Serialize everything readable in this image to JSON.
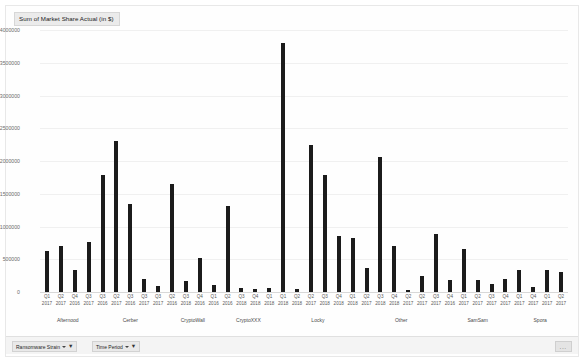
{
  "chart_data": {
    "type": "bar",
    "title": "Sum of Market Share Actual (in $)",
    "xlabel": "",
    "ylabel": "",
    "ylim": [
      0,
      4000000
    ],
    "grid": true,
    "legend_position": "none",
    "ytick_labels": [
      "4000000",
      "3500000",
      "3000000",
      "2500000",
      "2000000",
      "1500000",
      "1000000",
      "500000",
      "0"
    ],
    "ytick_values": [
      4000000,
      3500000,
      3000000,
      2500000,
      2000000,
      1500000,
      1000000,
      500000,
      0
    ],
    "groups": [
      {
        "name": "Afternood",
        "start_index": 0,
        "count": 4
      },
      {
        "name": "Cerber",
        "start_index": 4,
        "count": 5
      },
      {
        "name": "CryptoWall",
        "start_index": 9,
        "count": 4
      },
      {
        "name": "CryptoXXX",
        "start_index": 13,
        "count": 4
      },
      {
        "name": "Locky",
        "start_index": 17,
        "count": 6
      },
      {
        "name": "Other",
        "start_index": 23,
        "count": 6
      },
      {
        "name": "SamSam",
        "start_index": 29,
        "count": 5
      },
      {
        "name": "Spora",
        "start_index": 34,
        "count": 4
      }
    ],
    "categories": [
      {
        "quarter": "Q1",
        "year": "2017"
      },
      {
        "quarter": "Q2",
        "year": "2017"
      },
      {
        "quarter": "Q4",
        "year": "2016"
      },
      {
        "quarter": "Q3",
        "year": "2017"
      },
      {
        "quarter": "Q3",
        "year": "2016"
      },
      {
        "quarter": "Q2",
        "year": "2017"
      },
      {
        "quarter": "Q3",
        "year": "2016"
      },
      {
        "quarter": "Q3",
        "year": "2017"
      },
      {
        "quarter": "Q3",
        "year": "2017"
      },
      {
        "quarter": "Q2",
        "year": "2016"
      },
      {
        "quarter": "Q3",
        "year": "2018"
      },
      {
        "quarter": "Q4",
        "year": "2016"
      },
      {
        "quarter": "Q1",
        "year": "2016"
      },
      {
        "quarter": "Q2",
        "year": "2016"
      },
      {
        "quarter": "Q3",
        "year": "2018"
      },
      {
        "quarter": "Q4",
        "year": "2018"
      },
      {
        "quarter": "Q1",
        "year": "2018"
      },
      {
        "quarter": "Q1",
        "year": "2018"
      },
      {
        "quarter": "Q2",
        "year": "2018"
      },
      {
        "quarter": "Q2",
        "year": "2017"
      },
      {
        "quarter": "Q3",
        "year": "2018"
      },
      {
        "quarter": "Q4",
        "year": "2018"
      },
      {
        "quarter": "Q1",
        "year": "2018"
      },
      {
        "quarter": "Q2",
        "year": "2017"
      },
      {
        "quarter": "Q3",
        "year": "2018"
      },
      {
        "quarter": "Q4",
        "year": "2018"
      },
      {
        "quarter": "Q2",
        "year": "2017"
      },
      {
        "quarter": "Q2",
        "year": "2017"
      },
      {
        "quarter": "Q3",
        "year": "2017"
      },
      {
        "quarter": "Q4",
        "year": "2016"
      },
      {
        "quarter": "Q1",
        "year": "2017"
      },
      {
        "quarter": "Q2",
        "year": "2017"
      },
      {
        "quarter": "Q3",
        "year": "2017"
      },
      {
        "quarter": "Q4",
        "year": "2017"
      },
      {
        "quarter": "Q1",
        "year": "2017"
      },
      {
        "quarter": "Q4",
        "year": "2017"
      },
      {
        "quarter": "Q1",
        "year": "2017"
      },
      {
        "quarter": "Q2",
        "year": "2017"
      }
    ],
    "values": [
      620000,
      700000,
      330000,
      760000,
      1780000,
      2310000,
      1340000,
      200000,
      90000,
      1650000,
      170000,
      520000,
      100000,
      1310000,
      60000,
      40000,
      60000,
      3800000,
      40000,
      2240000,
      1790000,
      850000,
      820000,
      370000,
      2060000,
      700000,
      30000,
      250000,
      880000,
      180000,
      660000,
      180000,
      130000,
      200000,
      330000,
      80000,
      330000,
      310000
    ]
  },
  "filters": {
    "strain": {
      "label": "Ransomware Strain",
      "caret": "chevron-down-icon",
      "icon": "funnel-icon"
    },
    "period": {
      "label": "Time Period",
      "caret": "chevron-down-icon",
      "icon": "funnel-icon"
    },
    "corner": "..."
  }
}
